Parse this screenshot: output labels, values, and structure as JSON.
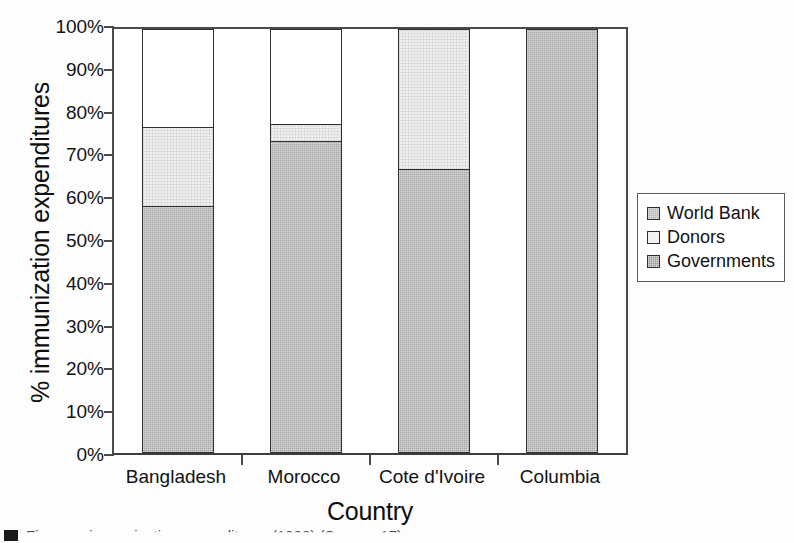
{
  "chart_data": {
    "type": "bar",
    "subtype": "stacked-100-percent",
    "title": "",
    "xlabel": "Country",
    "ylabel": "% immunization expenditures",
    "categories": [
      "Bangladesh",
      "Morocco",
      "Cote d'Ivoire",
      "Columbia"
    ],
    "series": [
      {
        "name": "Governments",
        "values": [
          58.3,
          73.5,
          67.0,
          100.0
        ],
        "color": "#a8a8a8"
      },
      {
        "name": "Donors",
        "values": [
          18.7,
          4.0,
          33.0,
          0.0
        ],
        "color": "#f0f0f0"
      },
      {
        "name": "World Bank",
        "values": [
          23.0,
          22.5,
          0.0,
          0.0
        ],
        "color": "#ffffff"
      }
    ],
    "stack_order_bottom_to_top": [
      "Governments",
      "Donors",
      "World Bank"
    ],
    "ylim": [
      0,
      100
    ],
    "yticks": [
      0,
      10,
      20,
      30,
      40,
      50,
      60,
      70,
      80,
      90,
      100
    ],
    "ytick_labels": [
      "0%",
      "10%",
      "20%",
      "30%",
      "40%",
      "50%",
      "60%",
      "70%",
      "80%",
      "90%",
      "100%"
    ],
    "grid": false,
    "legend_position": "right",
    "legend_entries": [
      "World Bank",
      "Donors",
      "Governments"
    ]
  },
  "axes": {
    "y_title": "% immunization expenditures",
    "x_title": "Country",
    "y_ticks": [
      {
        "label": "100%",
        "value": 100
      },
      {
        "label": "90%",
        "value": 90
      },
      {
        "label": "80%",
        "value": 80
      },
      {
        "label": "70%",
        "value": 70
      },
      {
        "label": "60%",
        "value": 60
      },
      {
        "label": "50%",
        "value": 50
      },
      {
        "label": "40%",
        "value": 40
      },
      {
        "label": "30%",
        "value": 30
      },
      {
        "label": "20%",
        "value": 20
      },
      {
        "label": "10%",
        "value": 10
      },
      {
        "label": "0%",
        "value": 0
      }
    ],
    "x_categories": [
      "Bangladesh",
      "Morocco",
      "Cote d'Ivoire",
      "Columbia"
    ]
  },
  "legend": {
    "items": [
      {
        "label": "World Bank",
        "swatch": "legend-swatch-world-bank",
        "color": "#b0b0b0"
      },
      {
        "label": "Donors",
        "swatch": "legend-swatch-donors",
        "color": "#f2f2f2"
      },
      {
        "label": "Governments",
        "swatch": "legend-swatch-governments",
        "color": "#9a9a9a"
      }
    ]
  },
  "caption": {
    "marker": "",
    "text": "Figure ... immunization expenditures (1998) (Source: 17)"
  },
  "colors": {
    "governments": "#a8a8a8",
    "donors": "#f0f0f0",
    "world_bank": "#ffffff",
    "axis": "#4a4a4a",
    "segment_border": "#303030",
    "text": "#121212"
  }
}
